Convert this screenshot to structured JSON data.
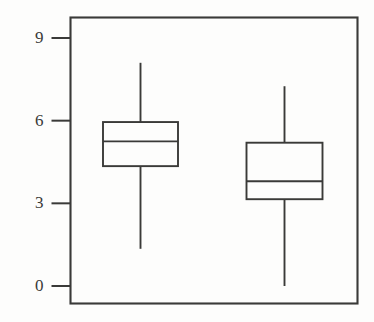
{
  "chart_data": {
    "type": "box",
    "title": "",
    "xlabel": "",
    "ylabel": "",
    "ylim": [
      -0.35,
      9.55
    ],
    "grid": false,
    "legend": null,
    "y_ticks": [
      0,
      3,
      6,
      9
    ],
    "y_tick_labels": [
      "0",
      "3",
      "6",
      "9"
    ],
    "x_ticks": [],
    "x_tick_labels": [],
    "categories": [
      "1",
      "2"
    ],
    "boxes": [
      {
        "name": "1",
        "center": 1,
        "whisker_low": 1.35,
        "q1": 4.35,
        "median": 5.25,
        "q3": 5.95,
        "whisker_high": 8.1,
        "outliers": []
      },
      {
        "name": "2",
        "center": 2,
        "whisker_low": 0.0,
        "q1": 3.15,
        "median": 3.8,
        "q3": 5.2,
        "whisker_high": 7.25,
        "outliers": []
      }
    ]
  },
  "style": {
    "line_color": "#3a3a38",
    "frame_color": "#3a3a38",
    "box_fill": "none",
    "background": "#fdfdfc",
    "tick_color": "#3a3a38"
  }
}
